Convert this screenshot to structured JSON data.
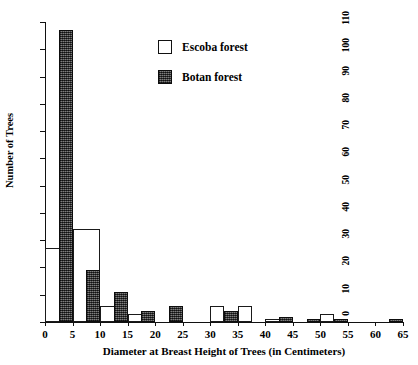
{
  "chart_data": {
    "type": "bar",
    "title": "",
    "xlabel": "Diameter at Breast Height of Trees (in Centimeters)",
    "ylabel": "Number of Trees",
    "xlim": [
      0,
      65
    ],
    "ylim": [
      0,
      110
    ],
    "xticks": [
      0,
      5,
      10,
      15,
      20,
      25,
      30,
      35,
      40,
      45,
      50,
      55,
      60,
      65
    ],
    "yticks": [
      0,
      10,
      20,
      30,
      40,
      50,
      60,
      70,
      80,
      90,
      100,
      110
    ],
    "grid": false,
    "legend_position": "upper-center",
    "bin_width": 5,
    "series": [
      {
        "name": "Escoba forest",
        "style": "open",
        "color": "#ffffff",
        "edge_color": "#1a1a1a",
        "bars": [
          {
            "x_start": 0,
            "x_end": 5,
            "value": 27
          },
          {
            "x_start": 5,
            "x_end": 10,
            "value": 34
          },
          {
            "x_start": 10,
            "x_end": 15,
            "value": 6
          },
          {
            "x_start": 15,
            "x_end": 20,
            "value": 3
          },
          {
            "x_start": 30,
            "x_end": 32.5,
            "value": 6
          },
          {
            "x_start": 35,
            "x_end": 37.5,
            "value": 6
          },
          {
            "x_start": 40,
            "x_end": 45,
            "value": 1
          },
          {
            "x_start": 50,
            "x_end": 52.5,
            "value": 3
          }
        ]
      },
      {
        "name": "Botan forest",
        "style": "stippled",
        "color": "#4a4a4a",
        "edge_color": "#0d0d0d",
        "bars": [
          {
            "x_start": 2.5,
            "x_end": 5,
            "value": 107
          },
          {
            "x_start": 7.5,
            "x_end": 10,
            "value": 19
          },
          {
            "x_start": 12.5,
            "x_end": 15,
            "value": 11
          },
          {
            "x_start": 17.5,
            "x_end": 20,
            "value": 4
          },
          {
            "x_start": 22.5,
            "x_end": 25,
            "value": 6
          },
          {
            "x_start": 32.5,
            "x_end": 35,
            "value": 4
          },
          {
            "x_start": 42.5,
            "x_end": 45,
            "value": 2
          },
          {
            "x_start": 47.5,
            "x_end": 50,
            "value": 1
          },
          {
            "x_start": 52.5,
            "x_end": 55,
            "value": 1
          },
          {
            "x_start": 62.5,
            "x_end": 65,
            "value": 1
          }
        ]
      }
    ]
  }
}
